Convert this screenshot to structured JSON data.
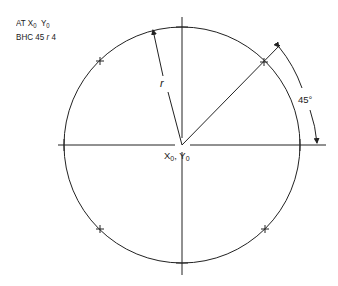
{
  "notes": {
    "line1_prefix": "AT X",
    "line1_sub1": "0",
    "line1_mid": "Y",
    "line1_sub2": "0",
    "line2_prefix": "BHC 45 ",
    "line2_r": "r",
    "line2_suffix": " 4"
  },
  "diagram": {
    "radius_label": "r",
    "angle_label": "45°",
    "center_label_x": "X",
    "center_label_x_sub": "0",
    "center_label_sep": ", Y",
    "center_label_y_sub": "0",
    "hole_count": 4,
    "start_angle_deg": 45,
    "stroke_color": "#222222"
  }
}
